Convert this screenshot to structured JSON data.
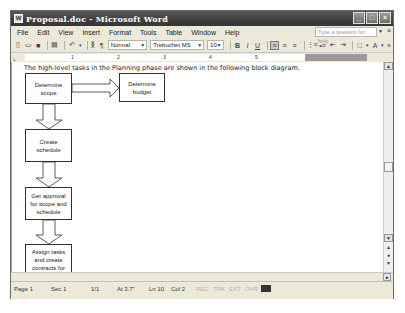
{
  "window": {
    "title": "Proposal.doc - Microsoft Word",
    "controls": {
      "minimize": "_",
      "maximize": "□",
      "close": "×"
    }
  },
  "menubar": {
    "items": [
      "File",
      "Edit",
      "View",
      "Insert",
      "Format",
      "Tools",
      "Table",
      "Window",
      "Help"
    ],
    "help_placeholder": "Type a question for help"
  },
  "toolbar": {
    "style": "Normal",
    "font": "Trebuchet MS",
    "size": "10",
    "bold": "B",
    "italic": "I",
    "underline": "U"
  },
  "ruler": {
    "numbers": [
      "1",
      "2",
      "3",
      "4",
      "5"
    ]
  },
  "document": {
    "intro_text": "The high-level tasks in the Planning phase are shown in the following block diagram.",
    "diagram": {
      "boxes": [
        {
          "id": "determine-scope",
          "lines": [
            "Determine",
            "scope"
          ]
        },
        {
          "id": "determine-budget",
          "lines": [
            "Determine",
            "budget"
          ]
        },
        {
          "id": "create-schedule",
          "lines": [
            "Create",
            "schedule"
          ]
        },
        {
          "id": "get-approval",
          "lines": [
            "Get approval",
            "for scope and",
            "schedule"
          ]
        },
        {
          "id": "assign-tasks",
          "lines": [
            "Assign tasks",
            "and create",
            "contracts for",
            "vendors"
          ]
        }
      ]
    }
  },
  "statusbar": {
    "page": "Page 1",
    "section": "Sec 1",
    "page_of": "1/1",
    "at": "At 3.7\"",
    "line": "Ln 10",
    "col": "Col 2",
    "rec": "REC",
    "trk": "TRK",
    "ext": "EXT",
    "ovr": "OVR"
  },
  "colors": {
    "titlebar": "#404040",
    "chrome": "#ece9d8",
    "page": "#ffffff"
  }
}
